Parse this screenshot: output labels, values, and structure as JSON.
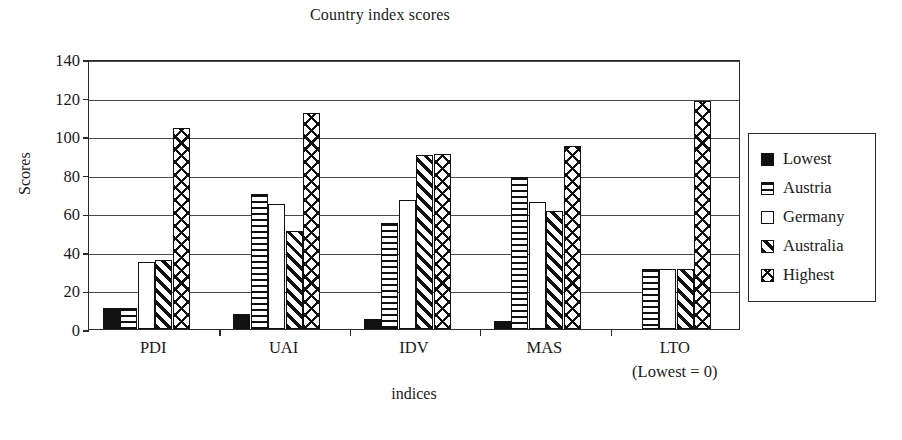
{
  "chart_data": {
    "type": "bar",
    "title": "Country index scores",
    "xlabel": "indices",
    "ylabel": "Scores",
    "categories": [
      "PDI",
      "UAI",
      "IDV",
      "MAS",
      "LTO"
    ],
    "category_notes": [
      "",
      "",
      "",
      "",
      "(Lowest = 0)"
    ],
    "series": [
      {
        "name": "Lowest",
        "pattern": "solid",
        "values": [
          11,
          8,
          5,
          4,
          0
        ]
      },
      {
        "name": "Austria",
        "pattern": "hstripe",
        "values": [
          11,
          70,
          55,
          79,
          31
        ]
      },
      {
        "name": "Germany",
        "pattern": "empty",
        "values": [
          35,
          65,
          67,
          66,
          31
        ]
      },
      {
        "name": "Australia",
        "pattern": "diag",
        "values": [
          36,
          51,
          90,
          61,
          31
        ]
      },
      {
        "name": "Highest",
        "pattern": "cross",
        "values": [
          104,
          112,
          91,
          95,
          118
        ]
      }
    ],
    "ylim": [
      0,
      140
    ],
    "yticks": [
      0,
      20,
      40,
      60,
      80,
      100,
      120,
      140
    ],
    "grid": true,
    "legend_position": "right"
  }
}
